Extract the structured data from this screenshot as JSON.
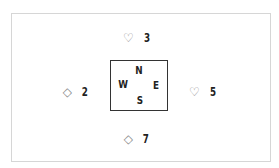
{
  "diagram": {
    "type": "bridge-trick",
    "directions": {
      "north": "N",
      "east": "E",
      "south": "S",
      "west": "W"
    },
    "cards": {
      "north": {
        "suit": "♡",
        "suit_name": "hearts",
        "rank": "3"
      },
      "west": {
        "suit": "◇",
        "suit_name": "diamonds",
        "rank": "2"
      },
      "east": {
        "suit": "♡",
        "suit_name": "hearts",
        "rank": "5"
      },
      "south": {
        "suit": "◇",
        "suit_name": "diamonds",
        "rank": "7"
      }
    }
  }
}
